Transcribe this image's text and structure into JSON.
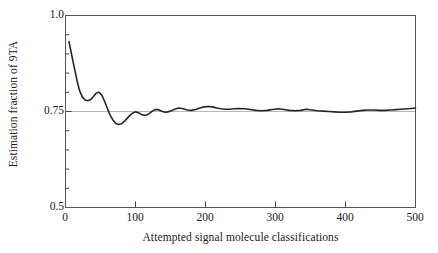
{
  "chart_data": {
    "type": "line",
    "title": "",
    "subtitle": "",
    "xlabel": "Attempted signal molecule classifications",
    "ylabel": "Estimation fraction of 9TA",
    "xlim": [
      0,
      500
    ],
    "ylim": [
      0.5,
      1.0
    ],
    "xticks": [
      0,
      100,
      200,
      300,
      400,
      500
    ],
    "xtick_labels": [
      "0",
      "100",
      "200",
      "300",
      "400",
      "500"
    ],
    "yticks": [
      0.5,
      0.75,
      1.0
    ],
    "ytick_labels": [
      "0.5",
      "0.75",
      "1.0"
    ],
    "yminorticks": [
      0.55,
      0.6,
      0.65,
      0.7,
      0.8,
      0.85,
      0.9,
      0.95
    ],
    "grid": "horizontal-reference-line-at-0.75",
    "gridline_values": [
      0.75
    ],
    "legend": "none",
    "series": [
      {
        "name": "Estimation fraction of 9TA",
        "color": "#262626",
        "linewidth": 1.6,
        "x": [
          5,
          8,
          11,
          14,
          17,
          20,
          24,
          28,
          32,
          36,
          40,
          44,
          48,
          52,
          56,
          60,
          64,
          68,
          72,
          76,
          80,
          84,
          88,
          92,
          96,
          100,
          104,
          108,
          112,
          116,
          120,
          124,
          128,
          132,
          136,
          140,
          144,
          150,
          156,
          162,
          168,
          174,
          180,
          186,
          192,
          198,
          204,
          210,
          216,
          222,
          228,
          234,
          240,
          248,
          256,
          264,
          272,
          280,
          288,
          296,
          304,
          312,
          320,
          328,
          336,
          344,
          352,
          360,
          368,
          376,
          384,
          392,
          400,
          408,
          416,
          424,
          432,
          440,
          448,
          456,
          464,
          472,
          480,
          488,
          494,
          500
        ],
        "y": [
          0.932,
          0.905,
          0.878,
          0.852,
          0.826,
          0.805,
          0.788,
          0.78,
          0.778,
          0.781,
          0.789,
          0.798,
          0.8,
          0.792,
          0.776,
          0.757,
          0.74,
          0.727,
          0.719,
          0.716,
          0.718,
          0.724,
          0.732,
          0.74,
          0.746,
          0.749,
          0.747,
          0.743,
          0.74,
          0.741,
          0.745,
          0.751,
          0.755,
          0.755,
          0.752,
          0.749,
          0.748,
          0.751,
          0.756,
          0.759,
          0.757,
          0.754,
          0.753,
          0.755,
          0.759,
          0.762,
          0.763,
          0.762,
          0.759,
          0.757,
          0.756,
          0.756,
          0.757,
          0.758,
          0.757,
          0.755,
          0.753,
          0.752,
          0.753,
          0.755,
          0.757,
          0.755,
          0.753,
          0.752,
          0.753,
          0.756,
          0.754,
          0.752,
          0.751,
          0.75,
          0.749,
          0.748,
          0.748,
          0.749,
          0.751,
          0.753,
          0.754,
          0.754,
          0.753,
          0.753,
          0.754,
          0.755,
          0.756,
          0.757,
          0.758,
          0.759
        ]
      }
    ]
  },
  "axes": {
    "frame_color": "#555555",
    "gridline_color": "#b0b0b0",
    "tick_color": "#444444"
  }
}
